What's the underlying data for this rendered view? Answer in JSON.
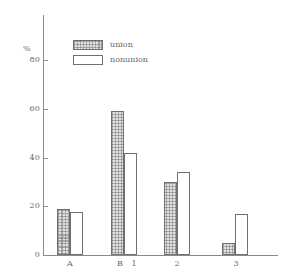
{
  "chart_data": {
    "type": "bar",
    "title": "",
    "subtitle": "",
    "xlabel": "",
    "ylabel": "%",
    "ylim": [
      0,
      85
    ],
    "yticks": [
      0,
      20,
      40,
      60,
      80
    ],
    "ytick_labels": [
      "0",
      "20",
      "40",
      "60",
      "80"
    ],
    "grid": false,
    "legend_position": "top-left",
    "categories": [
      "A",
      "B",
      "1",
      "2",
      "3"
    ],
    "series": [
      {
        "name": "union",
        "values": [
          19,
          59,
          null,
          30,
          5
        ]
      },
      {
        "name": "nonunion",
        "values": [
          17.5,
          42,
          null,
          34,
          17
        ]
      }
    ]
  },
  "axis": {
    "percent_symbol": "%",
    "tick_80": "80",
    "tick_60": "60",
    "tick_40": "40",
    "tick_20": "20",
    "tick_0": "0"
  },
  "xlabels": {
    "a": "A",
    "b": "B",
    "one": "1",
    "two": "2",
    "three": "3"
  },
  "legend": {
    "union_label": "union",
    "nonunion_label": "nonunion"
  },
  "colors": {
    "line": "#8a8a8a",
    "bar_outline": "#707070",
    "union_fill": "#e3e3e3",
    "nonunion_fill": "#ffffff",
    "text": "#6a6a6a"
  }
}
